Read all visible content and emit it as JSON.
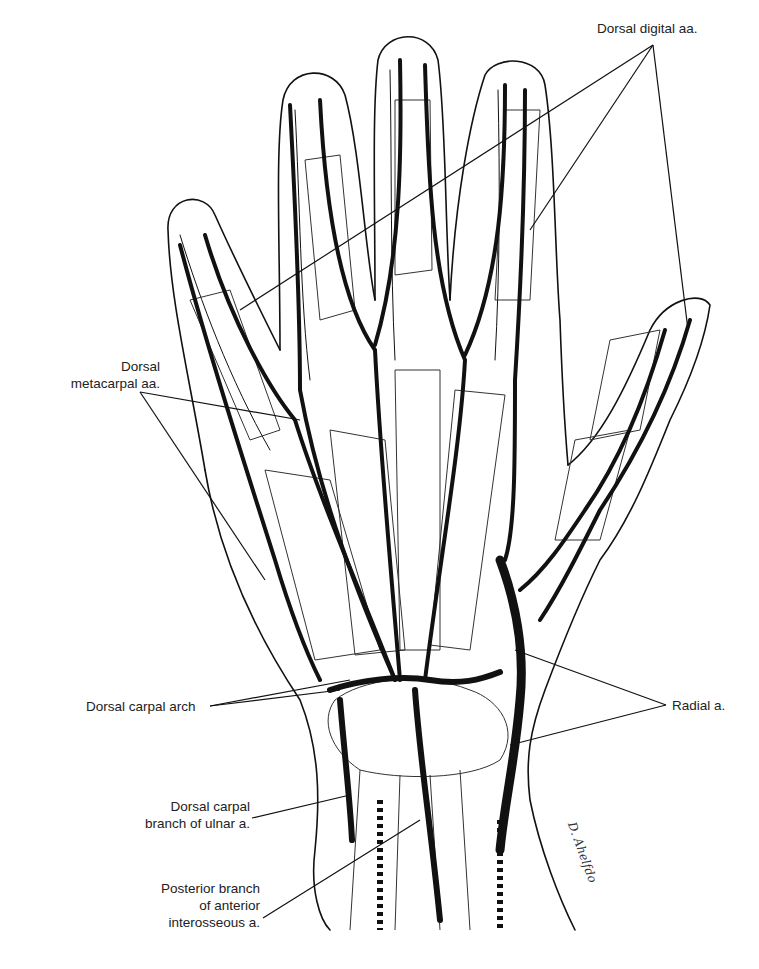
{
  "figure": {
    "colors": {
      "line": "#111111",
      "background": "#ffffff",
      "text": "#222222"
    }
  },
  "labels": {
    "dorsal_digital": "Dorsal digital aa.",
    "dorsal_metacarpal_1": "Dorsal",
    "dorsal_metacarpal_2": "metacarpal aa.",
    "dorsal_carpal_arch": "Dorsal carpal arch",
    "radial": "Radial a.",
    "ulnar_branch_1": "Dorsal carpal",
    "ulnar_branch_2": "branch of ulnar a.",
    "interosseous_1": "Posterior branch",
    "interosseous_2": "of anterior",
    "interosseous_3": "interosseous  a."
  },
  "signature": "D. Ahelfdo"
}
